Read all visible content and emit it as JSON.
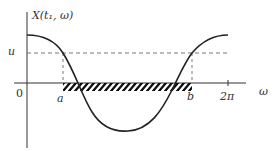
{
  "diagram": {
    "type": "level-crossing plot",
    "y_axis_label": "X(t₁, ω)",
    "x_axis_label": "ω",
    "level_label": "u",
    "origin_label": "0",
    "crossing_labels": {
      "a": "a",
      "b": "b"
    },
    "period_tick_label": "2π",
    "curve": "cosine-like curve starting above level u, crossing u downward at a, minimum near center, crossing u upward at b, ending near 2π",
    "hatched_interval": "interval from a to b on the ω-axis where X(t₁, ω) < u",
    "colors": {
      "curve": "#222222",
      "axes": "#333333",
      "dashed": "#555555",
      "hatch": "#111111"
    }
  }
}
